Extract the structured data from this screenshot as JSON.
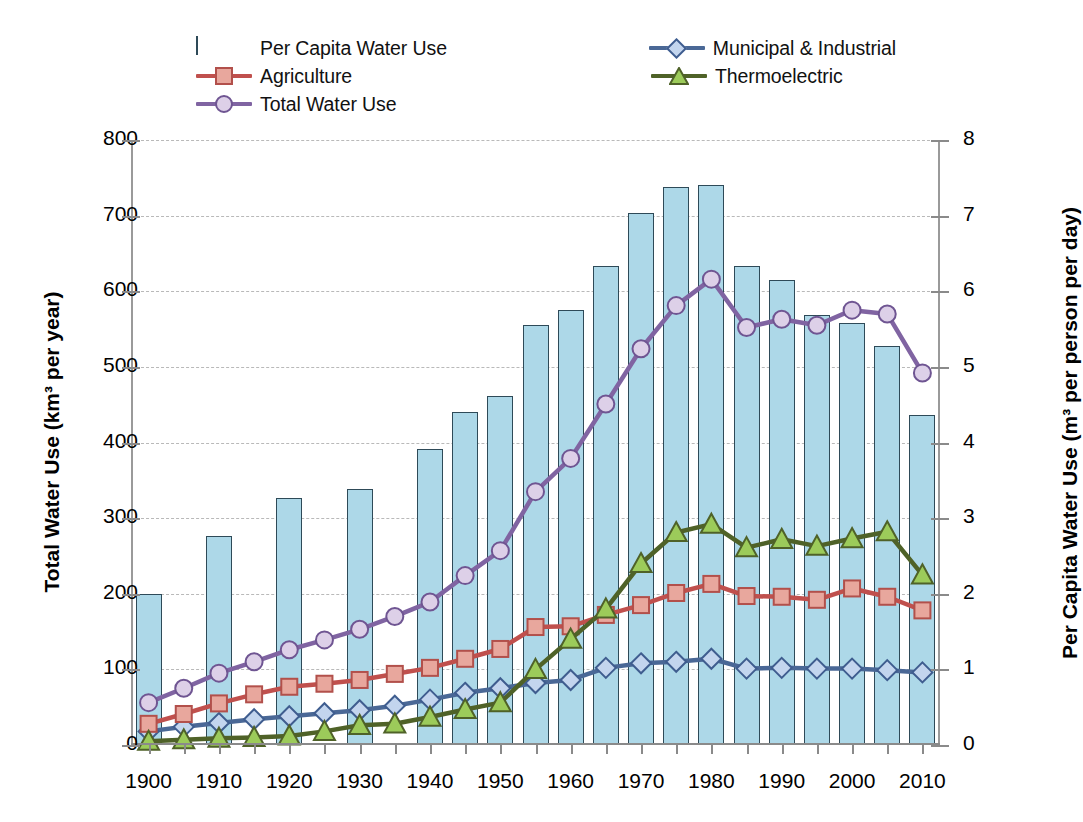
{
  "chart_data": {
    "type": "bar",
    "title": "",
    "xlabel": "",
    "ylabel": "Total Water Use (km³ per year)",
    "y2label": "Per Capita Water Use (m³ per person per day)",
    "ylim": [
      0,
      800
    ],
    "y2lim": [
      0,
      8
    ],
    "yticks": [
      "0",
      "100",
      "200",
      "300",
      "400",
      "500",
      "600",
      "700",
      "800"
    ],
    "y2ticks": [
      "0",
      "1",
      "2",
      "3",
      "4",
      "5",
      "6",
      "7",
      "8"
    ],
    "xticklabels": [
      "1900",
      "1910",
      "1920",
      "1930",
      "1940",
      "1950",
      "1960",
      "1970",
      "1980",
      "1990",
      "2000",
      "2010"
    ],
    "xlim": [
      1897.5,
      2012.5
    ],
    "grid": "horizontal-dashed",
    "legend_position": "top",
    "bar_series": {
      "name": "Per Capita Water Use",
      "axis": "right",
      "unit": "m³ per person per day",
      "color": "#add8e8",
      "edge_color": "#2e4a58",
      "x": [
        1900,
        1910,
        1920,
        1930,
        1940,
        1945,
        1950,
        1955,
        1960,
        1965,
        1970,
        1975,
        1980,
        1985,
        1990,
        1995,
        2000,
        2005,
        2010
      ],
      "values_km3_scale": [
        200,
        276,
        326,
        339,
        392,
        440,
        461,
        556,
        575,
        634,
        703,
        738,
        741,
        633,
        615,
        568,
        558,
        527,
        437
      ],
      "values": [
        2.0,
        2.76,
        3.26,
        3.39,
        3.92,
        4.4,
        4.61,
        5.56,
        5.75,
        6.34,
        7.03,
        7.38,
        7.41,
        6.33,
        6.15,
        5.68,
        5.58,
        5.27,
        4.37
      ]
    },
    "line_series": [
      {
        "name": "Municipal & Industrial",
        "axis": "left",
        "line_color": "#4a6896",
        "marker": "diamond",
        "marker_fill": "#c3d5ee",
        "marker_edge": "#3f5d8f",
        "x": [
          1900,
          1905,
          1910,
          1915,
          1920,
          1925,
          1930,
          1935,
          1940,
          1945,
          1950,
          1955,
          1960,
          1965,
          1970,
          1975,
          1980,
          1985,
          1990,
          1995,
          2000,
          2005,
          2010
        ],
        "values": [
          18,
          24,
          29,
          34,
          38,
          42,
          46,
          52,
          60,
          69,
          75,
          82,
          86,
          102,
          108,
          110,
          114,
          101,
          102,
          101,
          101,
          99,
          96
        ]
      },
      {
        "name": "Agriculture",
        "axis": "left",
        "line_color": "#c0504d",
        "marker": "square",
        "marker_fill": "#e8a79d",
        "marker_edge": "#b2504b",
        "x": [
          1900,
          1905,
          1910,
          1915,
          1920,
          1925,
          1930,
          1935,
          1940,
          1945,
          1950,
          1955,
          1960,
          1965,
          1970,
          1975,
          1980,
          1985,
          1990,
          1995,
          2000,
          2005,
          2010
        ],
        "values": [
          28,
          41,
          55,
          67,
          77,
          81,
          86,
          94,
          102,
          114,
          127,
          156,
          157,
          172,
          185,
          201,
          213,
          197,
          196,
          192,
          207,
          196,
          178
        ]
      },
      {
        "name": "Thermoelectric",
        "axis": "left",
        "line_color": "#4f6228",
        "marker": "triangle",
        "marker_fill": "#9ccb5a",
        "marker_edge": "#4f6228",
        "x": [
          1900,
          1905,
          1910,
          1915,
          1920,
          1925,
          1930,
          1935,
          1940,
          1945,
          1950,
          1955,
          1960,
          1965,
          1970,
          1975,
          1980,
          1985,
          1990,
          1995,
          2000,
          2005,
          2010
        ],
        "values": [
          5,
          7,
          9,
          10,
          12,
          18,
          26,
          28,
          37,
          47,
          56,
          100,
          140,
          180,
          240,
          281,
          292,
          261,
          272,
          263,
          273,
          282,
          225
        ]
      },
      {
        "name": "Total Water Use",
        "axis": "left",
        "line_color": "#8064a2",
        "marker": "circle",
        "marker_fill": "#ddd0e8",
        "marker_edge": "#6f5592",
        "x": [
          1900,
          1905,
          1910,
          1915,
          1920,
          1925,
          1930,
          1935,
          1940,
          1945,
          1950,
          1955,
          1960,
          1965,
          1970,
          1975,
          1980,
          1985,
          1990,
          1995,
          2000,
          2005,
          2010
        ],
        "values": [
          56,
          75,
          95,
          110,
          126,
          139,
          153,
          170,
          189,
          224,
          257,
          335,
          379,
          451,
          524,
          581,
          616,
          552,
          563,
          555,
          575,
          570,
          492
        ]
      }
    ],
    "legend": [
      {
        "label": "Per Capita Water Use",
        "type": "bar",
        "color": "#add8e8"
      },
      {
        "label": "Municipal & Industrial",
        "type": "line-diamond",
        "color": "#4a6896"
      },
      {
        "label": "Agriculture",
        "type": "line-square",
        "color": "#c0504d"
      },
      {
        "label": "Thermoelectric",
        "type": "line-triangle",
        "color": "#4f6228"
      },
      {
        "label": "Total Water Use",
        "type": "line-circle",
        "color": "#8064a2"
      }
    ]
  }
}
